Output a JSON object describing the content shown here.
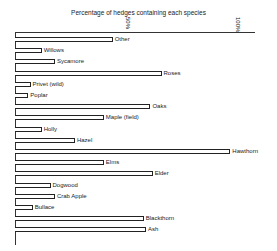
{
  "chart_data": {
    "type": "bar",
    "orientation": "horizontal",
    "title": "Percentage of hedges containing each species",
    "xlabel": "",
    "ylabel": "",
    "xlim": [
      0,
      100
    ],
    "ticks": [
      {
        "value": 50,
        "label": "50%"
      },
      {
        "value": 100,
        "label": "100%"
      }
    ],
    "grid": false,
    "categories": [
      "Other",
      "Willows",
      "Sycamore",
      "Roses",
      "Privet (wild)",
      "Poplar",
      "Oaks",
      "Maple (field)",
      "Holly",
      "Hazel",
      "Hawthorn",
      "Elms",
      "Elder",
      "Dogwood",
      "Crab Apple",
      "Bullace",
      "Blackthorn",
      "Ash"
    ],
    "values": [
      44,
      12,
      18,
      66,
      7,
      6,
      61,
      40,
      12,
      27,
      97,
      40,
      62,
      16,
      18,
      8,
      58,
      59
    ]
  },
  "title": "Percentage of hedges containing each species",
  "ticks": [
    "50%",
    "100%"
  ]
}
